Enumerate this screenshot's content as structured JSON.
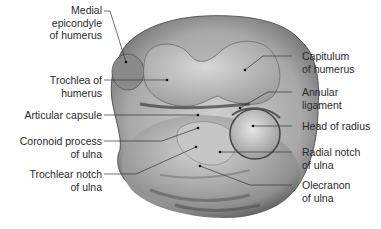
{
  "figure": {
    "labels_left": [
      {
        "id": "medial-epicondyle",
        "text": "Medial\nepicondyle\nof humerus"
      },
      {
        "id": "trochlea",
        "text": "Trochlea of\nhumerus"
      },
      {
        "id": "articular-capsule",
        "text": "Articular capsule"
      },
      {
        "id": "coronoid-process",
        "text": "Coronoid process\nof ulna"
      },
      {
        "id": "trochlear-notch",
        "text": "Trochlear notch\nof ulna"
      }
    ],
    "labels_right": [
      {
        "id": "capitulum",
        "text": "Capitulum\nof humerus"
      },
      {
        "id": "annular-ligament",
        "text": "Annular\nligament"
      },
      {
        "id": "head-of-radius",
        "text": "Head of radius"
      },
      {
        "id": "radial-notch",
        "text": "Radial notch\nof ulna"
      },
      {
        "id": "olecranon",
        "text": "Olecranon\nof ulna"
      }
    ]
  }
}
